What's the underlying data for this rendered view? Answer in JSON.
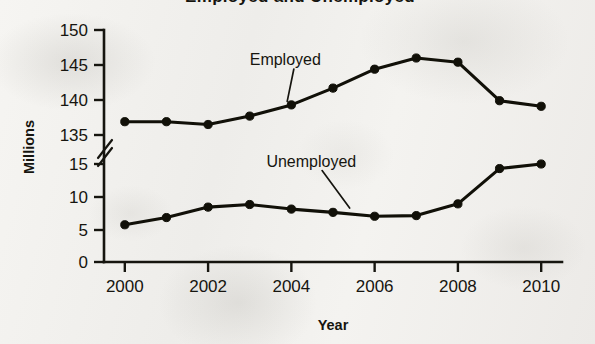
{
  "chart_data": {
    "type": "line",
    "title": "Employed and Unemployed",
    "title_visible": false,
    "xlabel": "Year",
    "ylabel": "Millions",
    "x": [
      2000,
      2001,
      2002,
      2003,
      2004,
      2005,
      2006,
      2007,
      2008,
      2009,
      2010
    ],
    "xtick_labels": [
      "2000",
      "2002",
      "2004",
      "2006",
      "2008",
      "2010"
    ],
    "xtick_values": [
      2000,
      2002,
      2004,
      2006,
      2008,
      2010
    ],
    "xlim": [
      1999.5,
      2010.5
    ],
    "broken_axis": true,
    "axis_break_symbol": "double-slash",
    "y_upper_ticks": [
      135,
      140,
      145,
      150
    ],
    "y_lower_ticks": [
      0,
      5,
      10,
      15
    ],
    "y_upper_range": [
      135,
      150
    ],
    "y_lower_range": [
      0,
      15
    ],
    "grid": false,
    "legend_position": "inline-annotations",
    "series": [
      {
        "name": "Employed",
        "axis_segment": "upper",
        "values": [
          136.9,
          136.9,
          136.5,
          137.7,
          139.3,
          141.7,
          144.4,
          146.0,
          145.4,
          139.9,
          139.1
        ],
        "label_anchor": {
          "x": 2003.0,
          "y": 145.0
        },
        "leader_to": {
          "x": 2003.9,
          "y": 139.1
        }
      },
      {
        "name": "Unemployed",
        "axis_segment": "lower",
        "values": [
          5.7,
          6.8,
          8.4,
          8.8,
          8.1,
          7.6,
          7.0,
          7.1,
          8.9,
          14.3,
          15.0
        ],
        "label_anchor": {
          "x": 2003.4,
          "y": 14.6
        },
        "leader_to": {
          "x": 2005.4,
          "y": 7.5
        }
      }
    ],
    "colors": {
      "ink": "#111008",
      "paper": "#f2f1ee",
      "employed_line": "#111008",
      "unemployed_line": "#111008"
    }
  }
}
